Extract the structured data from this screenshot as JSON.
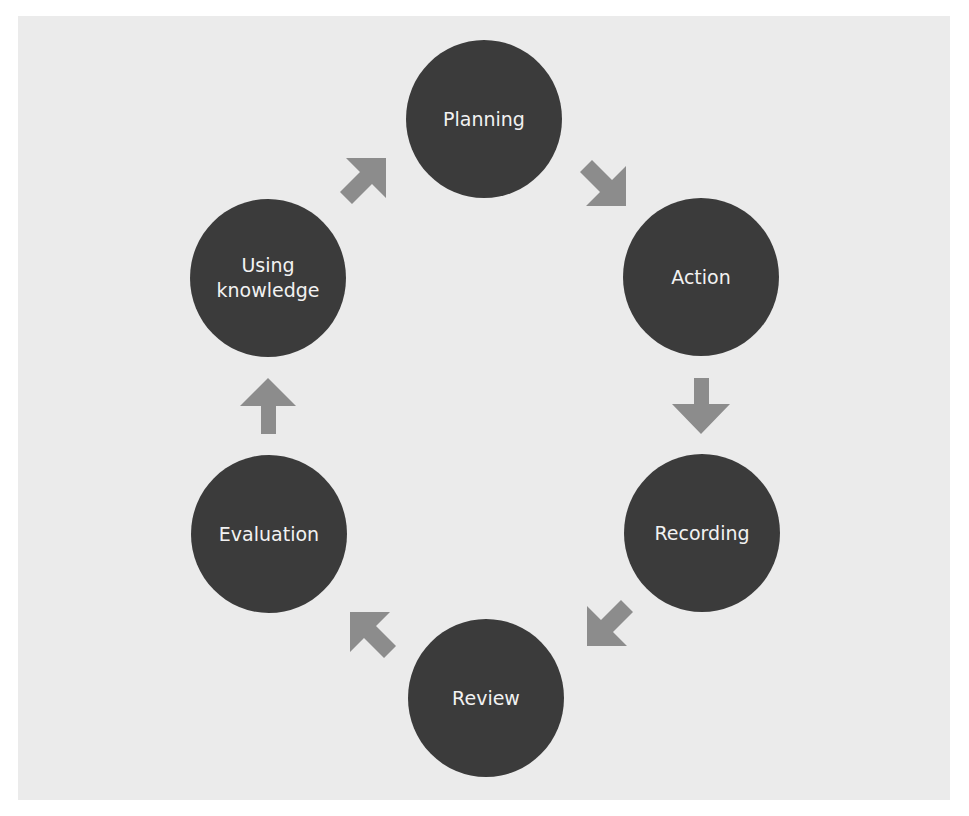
{
  "diagram": {
    "type": "cycle",
    "colors": {
      "background": "#ebebeb",
      "node_fill": "#3b3b3b",
      "node_text": "#f2f2f2",
      "arrow": "#8c8c8c"
    },
    "nodes": [
      {
        "id": "planning",
        "label": "Planning"
      },
      {
        "id": "action",
        "label": "Action"
      },
      {
        "id": "recording",
        "label": "Recording"
      },
      {
        "id": "review",
        "label": "Review"
      },
      {
        "id": "evaluation",
        "label": "Evaluation"
      },
      {
        "id": "using-knowledge",
        "label": "Using\nknowledge"
      }
    ],
    "arrows": [
      {
        "from": "planning",
        "to": "action",
        "direction": "down-right"
      },
      {
        "from": "action",
        "to": "recording",
        "direction": "down"
      },
      {
        "from": "recording",
        "to": "review",
        "direction": "down-left"
      },
      {
        "from": "review",
        "to": "evaluation",
        "direction": "up-left"
      },
      {
        "from": "evaluation",
        "to": "using-knowledge",
        "direction": "up"
      },
      {
        "from": "using-knowledge",
        "to": "planning",
        "direction": "up-right"
      }
    ]
  }
}
